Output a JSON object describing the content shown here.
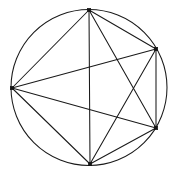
{
  "figure": {
    "shape_type": "inscribed-complete-graph",
    "background_color": "#ffffff",
    "stroke_color": "#1a1a1a",
    "vertex_color": "#141414",
    "stroke_width": 1.05,
    "vertex_size": 3.4
  },
  "chart_data": {
    "type": "scatter",
    "xlabel": "",
    "ylabel": "",
    "grid": false,
    "legend": false,
    "xlim": [
      0,
      172
    ],
    "ylim": [
      0,
      176
    ],
    "circle": {
      "cx": 89,
      "cy": 87.5,
      "r": 78.0
    },
    "vertex_labels": [
      "top",
      "upper-right",
      "lower-right",
      "bottom",
      "left"
    ],
    "x": [
      89,
      156,
      156,
      90,
      12
    ],
    "y": [
      10,
      49,
      128,
      164,
      88
    ],
    "vertices": [
      {
        "id": "top",
        "x": 89,
        "y": 10
      },
      {
        "id": "upper-right",
        "x": 156,
        "y": 49
      },
      {
        "id": "lower-right",
        "x": 156,
        "y": 128
      },
      {
        "id": "bottom",
        "x": 90,
        "y": 164
      },
      {
        "id": "left",
        "x": 12,
        "y": 88
      }
    ],
    "edges": [
      {
        "from": "top",
        "to": "upper-right"
      },
      {
        "from": "top",
        "to": "lower-right"
      },
      {
        "from": "top",
        "to": "bottom"
      },
      {
        "from": "top",
        "to": "left"
      },
      {
        "from": "upper-right",
        "to": "lower-right"
      },
      {
        "from": "upper-right",
        "to": "bottom"
      },
      {
        "from": "upper-right",
        "to": "left"
      },
      {
        "from": "lower-right",
        "to": "bottom"
      },
      {
        "from": "lower-right",
        "to": "left"
      },
      {
        "from": "bottom",
        "to": "left"
      }
    ],
    "edge_count": 10,
    "vertex_count": 5
  }
}
